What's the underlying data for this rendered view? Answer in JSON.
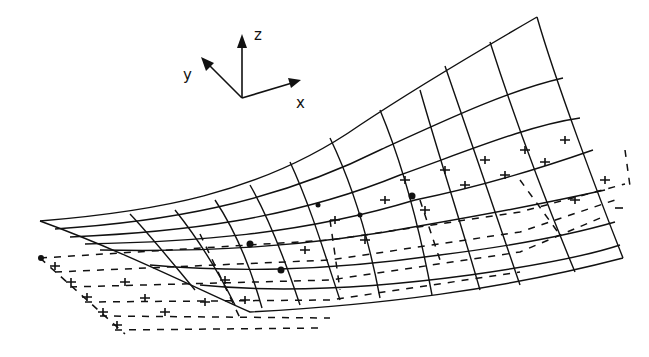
{
  "figure": {
    "type": "3D deformed surface mesh over flat reference grid",
    "axes": {
      "x_label": "x",
      "y_label": "y",
      "z_label": "z"
    },
    "legend": {
      "solid_mesh": "deformed surface",
      "dashed_grid": "undeformed reference plane",
      "cross_markers": "node markers"
    },
    "colors": {
      "line": "#111111",
      "background": "#ffffff"
    }
  }
}
